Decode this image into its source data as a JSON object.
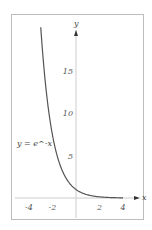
{
  "chart_data": {
    "type": "line",
    "title": "",
    "series": [
      {
        "name": "y = e^-x",
        "function": "exp(-x)",
        "x_range": [
          -3,
          4
        ]
      }
    ],
    "annotation": "y = e^-x",
    "xlabel": "x",
    "ylabel": "y",
    "xlim": [
      -4.5,
      4.5
    ],
    "ylim": [
      -2,
      21
    ],
    "x_ticks": [
      -4,
      -2,
      2,
      4
    ],
    "y_ticks": [
      5,
      10,
      15
    ],
    "x_tick_labels": [
      "-4",
      "-2",
      "2",
      "4"
    ],
    "y_tick_labels": [
      "5",
      "10",
      "15"
    ],
    "grid": false,
    "legend": "none"
  },
  "colors": {
    "curve": "#555555",
    "axes": "#cccccc",
    "frame": "#bdbdbd",
    "arrow": "#333333"
  }
}
